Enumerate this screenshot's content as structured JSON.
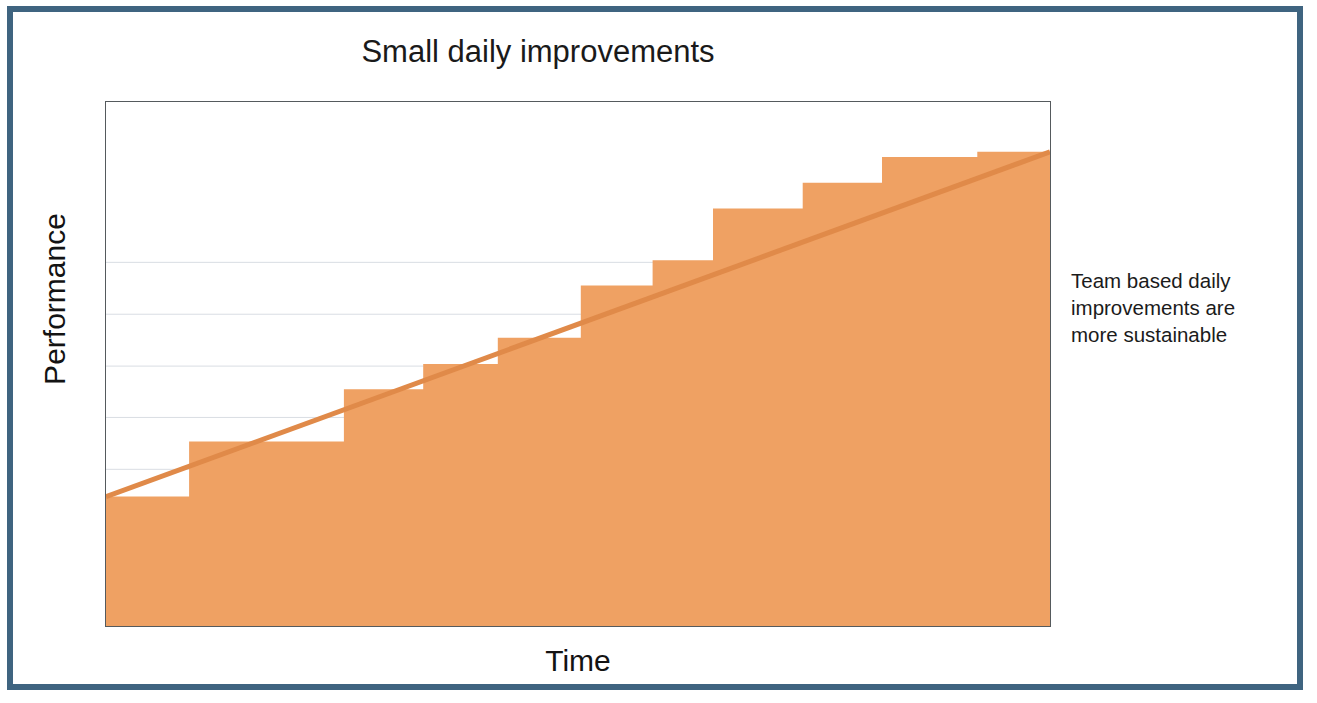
{
  "slide": {
    "frame_color": "#3f6480",
    "background": "#ffffff"
  },
  "annotation": {
    "full_text": "Team based daily improvements are more sustainable",
    "line1": "Team based daily",
    "line2": "improvements are",
    "line3": "more sustainable"
  },
  "chart_data": {
    "type": "area",
    "title": "Small daily improvements",
    "xlabel": "Time",
    "ylabel": "Performance",
    "series_name": "Performance over time",
    "fill_color": "#efa163",
    "trend_line_color": "#e08a49",
    "grid": true,
    "grid_color": "#d9dde3",
    "axis_color": "#555a5d",
    "xlim": [
      0,
      100
    ],
    "ylim": [
      0,
      100
    ],
    "x_tick_labels": [],
    "y_tick_labels": [],
    "gridline_values": [
      10.1,
      20.0,
      29.9,
      39.8,
      49.6,
      59.5,
      69.4
    ],
    "step_note": "Eleven discrete step increases; each step holds flat then jumps. A straight trend line runs from the first step corner to the last, showing cumulative compounding.",
    "steps": [
      {
        "index": 1,
        "x_start": 0.0,
        "x_end": 8.8,
        "value": 24.7
      },
      {
        "index": 2,
        "x_start": 8.8,
        "x_end": 25.2,
        "value": 35.2
      },
      {
        "index": 3,
        "x_start": 25.2,
        "x_end": 33.6,
        "value": 45.2
      },
      {
        "index": 4,
        "x_start": 33.6,
        "x_end": 41.5,
        "value": 50.0
      },
      {
        "index": 5,
        "x_start": 41.5,
        "x_end": 50.3,
        "value": 55.0
      },
      {
        "index": 6,
        "x_start": 50.3,
        "x_end": 57.9,
        "value": 65.0
      },
      {
        "index": 7,
        "x_start": 57.9,
        "x_end": 64.3,
        "value": 69.8
      },
      {
        "index": 8,
        "x_start": 64.3,
        "x_end": 73.8,
        "value": 79.7
      },
      {
        "index": 9,
        "x_start": 73.8,
        "x_end": 82.2,
        "value": 84.6
      },
      {
        "index": 10,
        "x_start": 82.2,
        "x_end": 92.3,
        "value": 89.5
      },
      {
        "index": 11,
        "x_start": 92.3,
        "x_end": 100.0,
        "value": 90.5
      }
    ],
    "trend_line": {
      "x1": 0.0,
      "y1": 24.7,
      "x2": 100.0,
      "y2": 90.5
    }
  }
}
